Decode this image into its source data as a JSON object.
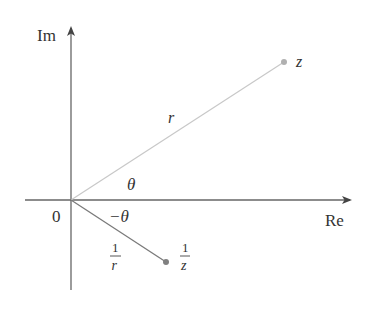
{
  "diagram": {
    "axes": {
      "imaginary_label": "Im",
      "real_label": "Re",
      "origin_label": "0"
    },
    "points": {
      "z": {
        "label": "z"
      },
      "reciprocal": {
        "numerator": "1",
        "denominator": "z"
      }
    },
    "segments": {
      "modulus_label": "r",
      "reciprocal_modulus": {
        "numerator": "1",
        "denominator": "r"
      }
    },
    "angles": {
      "theta_label": "θ",
      "neg_theta_label": "−θ"
    },
    "colors": {
      "axis": "#555555",
      "z_segment": "#c8c8c8",
      "z_point": "#b0b0b0",
      "reciprocal_segment": "#7a7a7a",
      "reciprocal_point": "#808080",
      "text": "#333333"
    }
  }
}
